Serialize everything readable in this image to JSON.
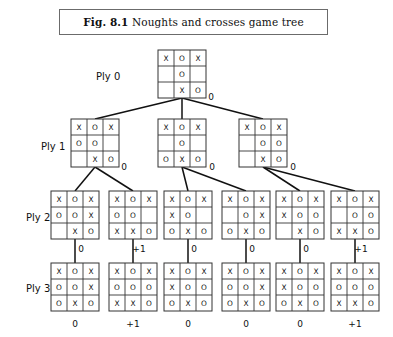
{
  "figure": {
    "caption_prefix": "Fig. 8.1",
    "caption_text": "Noughts and crosses game tree",
    "title": "Noughts and crosses game tree"
  },
  "ply_labels": [
    {
      "id": "ply-0",
      "label": "Ply 0",
      "x": 96,
      "y": 71
    },
    {
      "id": "ply-1",
      "label": "Ply 1",
      "x": 41,
      "y": 141
    },
    {
      "id": "ply-2",
      "label": "Ply 2",
      "x": 26,
      "y": 212
    },
    {
      "id": "ply-3",
      "label": "Ply 3",
      "x": 26,
      "y": 283
    }
  ],
  "symbols": {
    "cross": "X",
    "nought": "O",
    "empty": ""
  },
  "cell": {
    "size": 16,
    "stroke": "#333333"
  },
  "levels": [
    {
      "name": "ply-0",
      "y": 50,
      "nodes": [
        {
          "id": "root",
          "x": 158,
          "board": [
            [
              "X",
              "O",
              "X"
            ],
            [
              "",
              "O",
              ""
            ],
            [
              "",
              "X",
              "O"
            ]
          ]
        }
      ]
    },
    {
      "name": "ply-1",
      "y": 119,
      "nodes": [
        {
          "id": "p1-n1",
          "x": 71,
          "board": [
            [
              "X",
              "O",
              "X"
            ],
            [
              "O",
              "O",
              ""
            ],
            [
              "",
              "X",
              "O"
            ]
          ]
        },
        {
          "id": "p1-n2",
          "x": 158,
          "board": [
            [
              "X",
              "O",
              "X"
            ],
            [
              "",
              "O",
              ""
            ],
            [
              "O",
              "X",
              "O"
            ]
          ]
        },
        {
          "id": "p1-n3",
          "x": 239,
          "board": [
            [
              "X",
              "O",
              "X"
            ],
            [
              "",
              "O",
              "O"
            ],
            [
              "",
              "X",
              "O"
            ]
          ]
        }
      ]
    },
    {
      "name": "ply-2",
      "y": 191,
      "nodes": [
        {
          "id": "p2-n1",
          "x": 51,
          "board": [
            [
              "X",
              "O",
              "X"
            ],
            [
              "O",
              "O",
              "X"
            ],
            [
              "",
              "X",
              "O"
            ]
          ]
        },
        {
          "id": "p2-n2",
          "x": 109,
          "board": [
            [
              "X",
              "O",
              "X"
            ],
            [
              "O",
              "O",
              ""
            ],
            [
              "X",
              "X",
              "O"
            ]
          ]
        },
        {
          "id": "p2-n3",
          "x": 164,
          "board": [
            [
              "X",
              "O",
              "X"
            ],
            [
              "X",
              "O",
              ""
            ],
            [
              "O",
              "X",
              "O"
            ]
          ]
        },
        {
          "id": "p2-n4",
          "x": 222,
          "board": [
            [
              "X",
              "O",
              "X"
            ],
            [
              "",
              "O",
              "X"
            ],
            [
              "O",
              "X",
              "O"
            ]
          ]
        },
        {
          "id": "p2-n5",
          "x": 276,
          "board": [
            [
              "X",
              "O",
              "X"
            ],
            [
              "X",
              "O",
              "O"
            ],
            [
              "",
              "X",
              "O"
            ]
          ]
        },
        {
          "id": "p2-n6",
          "x": 331,
          "board": [
            [
              "X",
              "O",
              "X"
            ],
            [
              "",
              "O",
              "O"
            ],
            [
              "X",
              "X",
              "O"
            ]
          ]
        }
      ]
    },
    {
      "name": "ply-3",
      "y": 263,
      "nodes": [
        {
          "id": "p3-n1",
          "x": 51,
          "board": [
            [
              "X",
              "O",
              "X"
            ],
            [
              "O",
              "O",
              "X"
            ],
            [
              "O",
              "X",
              "O"
            ]
          ]
        },
        {
          "id": "p3-n2",
          "x": 109,
          "board": [
            [
              "X",
              "O",
              "X"
            ],
            [
              "O",
              "O",
              "O"
            ],
            [
              "X",
              "X",
              "O"
            ]
          ]
        },
        {
          "id": "p3-n3",
          "x": 164,
          "board": [
            [
              "X",
              "O",
              "X"
            ],
            [
              "X",
              "O",
              "O"
            ],
            [
              "O",
              "X",
              "O"
            ]
          ]
        },
        {
          "id": "p3-n4",
          "x": 222,
          "board": [
            [
              "X",
              "O",
              "X"
            ],
            [
              "O",
              "O",
              "X"
            ],
            [
              "O",
              "X",
              "O"
            ]
          ]
        },
        {
          "id": "p3-n5",
          "x": 276,
          "board": [
            [
              "X",
              "O",
              "X"
            ],
            [
              "X",
              "O",
              "O"
            ],
            [
              "O",
              "X",
              "O"
            ]
          ]
        },
        {
          "id": "p3-n6",
          "x": 331,
          "board": [
            [
              "X",
              "O",
              "X"
            ],
            [
              "O",
              "O",
              "O"
            ],
            [
              "X",
              "X",
              "O"
            ]
          ]
        }
      ]
    }
  ],
  "edges": [
    {
      "id": "e-root-1",
      "from": [
        182,
        98
      ],
      "to": [
        95,
        119
      ]
    },
    {
      "id": "e-root-2",
      "from": [
        182,
        98
      ],
      "to": [
        182,
        119
      ]
    },
    {
      "id": "e-root-3",
      "from": [
        182,
        98
      ],
      "to": [
        263,
        119
      ]
    },
    {
      "id": "e-p1n1-a",
      "from": [
        95,
        167
      ],
      "to": [
        75,
        191
      ]
    },
    {
      "id": "e-p1n1-b",
      "from": [
        95,
        167
      ],
      "to": [
        133,
        191
      ]
    },
    {
      "id": "e-p1n2-a",
      "from": [
        182,
        167
      ],
      "to": [
        188,
        191
      ]
    },
    {
      "id": "e-p1n2-b",
      "from": [
        182,
        167
      ],
      "to": [
        246,
        191
      ]
    },
    {
      "id": "e-p1n3-a",
      "from": [
        263,
        167
      ],
      "to": [
        300,
        191
      ]
    },
    {
      "id": "e-p1n3-b",
      "from": [
        263,
        167
      ],
      "to": [
        355,
        191
      ]
    },
    {
      "id": "e-p2n1-c",
      "from": [
        75,
        239
      ],
      "to": [
        75,
        263
      ]
    },
    {
      "id": "e-p2n2-c",
      "from": [
        133,
        239
      ],
      "to": [
        133,
        263
      ]
    },
    {
      "id": "e-p2n3-c",
      "from": [
        188,
        239
      ],
      "to": [
        188,
        263
      ]
    },
    {
      "id": "e-p2n4-c",
      "from": [
        246,
        239
      ],
      "to": [
        246,
        263
      ]
    },
    {
      "id": "e-p2n5-c",
      "from": [
        300,
        239
      ],
      "to": [
        300,
        263
      ]
    },
    {
      "id": "e-p2n6-c",
      "from": [
        355,
        239
      ],
      "to": [
        355,
        263
      ]
    }
  ],
  "edge_labels": [
    {
      "id": "lbl-root",
      "text": "0",
      "x": 211,
      "y": 100
    },
    {
      "id": "lbl-p1n1",
      "text": "0",
      "x": 124,
      "y": 170
    },
    {
      "id": "lbl-p1n2",
      "text": "0",
      "x": 212,
      "y": 170
    },
    {
      "id": "lbl-p1n3",
      "text": "0",
      "x": 293,
      "y": 170
    },
    {
      "id": "lbl-p2n1",
      "text": "0",
      "x": 81,
      "y": 252
    },
    {
      "id": "lbl-p2n2",
      "text": "+1",
      "x": 139,
      "y": 252
    },
    {
      "id": "lbl-p2n3",
      "text": "0",
      "x": 194,
      "y": 252
    },
    {
      "id": "lbl-p2n4",
      "text": "0",
      "x": 252,
      "y": 252
    },
    {
      "id": "lbl-p2n5",
      "text": "0",
      "x": 306,
      "y": 252
    },
    {
      "id": "lbl-p2n6",
      "text": "+1",
      "x": 361,
      "y": 252
    }
  ],
  "leaf_scores": [
    {
      "id": "score-1",
      "text": "0",
      "x": 75,
      "y": 327
    },
    {
      "id": "score-2",
      "text": "+1",
      "x": 133,
      "y": 327
    },
    {
      "id": "score-3",
      "text": "0",
      "x": 188,
      "y": 327
    },
    {
      "id": "score-4",
      "text": "0",
      "x": 246,
      "y": 327
    },
    {
      "id": "score-5",
      "text": "0",
      "x": 300,
      "y": 327
    },
    {
      "id": "score-6",
      "text": "+1",
      "x": 355,
      "y": 327
    }
  ]
}
